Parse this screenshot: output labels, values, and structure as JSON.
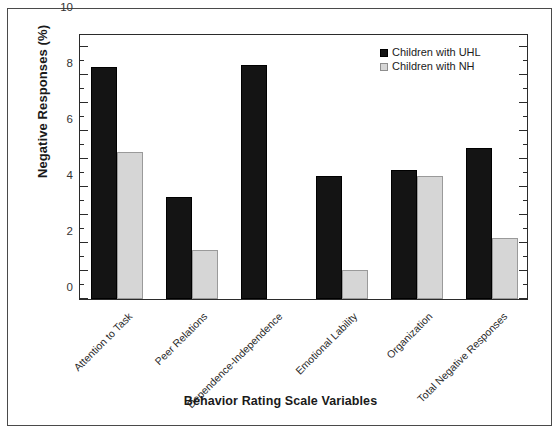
{
  "chart_data": {
    "type": "bar",
    "title": "",
    "xlabel": "Behavior Rating Scale Variables",
    "ylabel": "Negative Responses (%)",
    "ylim": [
      0,
      19
    ],
    "yticks": [
      0,
      2,
      4,
      6,
      8,
      10,
      12,
      14,
      16,
      18
    ],
    "ytick_labels": [
      "0",
      "2",
      "4",
      "6",
      "8",
      "10",
      "12",
      "14",
      "16",
      "18"
    ],
    "grid": false,
    "legend_position": "top-right",
    "categories": [
      "Attention to Task",
      "Peer Relations",
      "Dependence-Independence",
      "Emotional Lability",
      "Organization",
      "Total Negative Responses"
    ],
    "series": [
      {
        "name": "Children with UHL",
        "color": "#141414",
        "values": [
          16.6,
          7.3,
          16.7,
          8.8,
          9.2,
          10.8
        ]
      },
      {
        "name": "Children with NH",
        "color": "#d6d6d6",
        "values": [
          10.5,
          3.5,
          0,
          2.1,
          8.8,
          4.35
        ]
      }
    ]
  },
  "legend": {
    "items": [
      {
        "label": "Children with UHL",
        "swatch": "uhl"
      },
      {
        "label": "Children with NH",
        "swatch": "nh"
      }
    ]
  }
}
